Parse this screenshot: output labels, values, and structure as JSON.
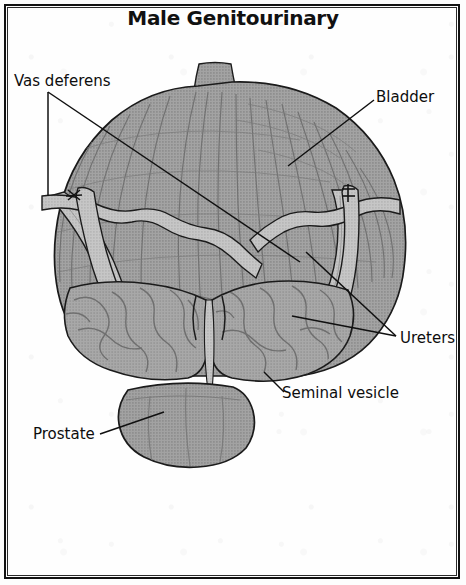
{
  "figure": {
    "title": "Male Genitourinary",
    "type": "anatomical-illustration",
    "style": "grayscale halftone line drawing",
    "border": "#121212",
    "background": "#fefefe"
  },
  "labels": {
    "vas_deferens": "Vas deferens",
    "bladder": "Bladder",
    "ureters": "Ureters",
    "seminal_vesicle": "Seminal  vesicle",
    "prostate": "Prostate"
  },
  "structures": [
    {
      "name": "bladder",
      "description": "large dome-shaped muscular organ with vertical detrusor striations, occupies upper two-thirds"
    },
    {
      "name": "urachus",
      "description": "small stalk at apex of bladder dome"
    },
    {
      "name": "ureter-left",
      "description": "pale tubular band descending from upper left into bladder base"
    },
    {
      "name": "ureter-right",
      "description": "pale tubular band descending vertically on right into bladder base"
    },
    {
      "name": "vas-deferens-left",
      "description": "pale tube crossing obliquely with cut marker"
    },
    {
      "name": "vas-deferens-right",
      "description": "pale tube crossing obliquely with cut marker"
    },
    {
      "name": "seminal-vesicle-left",
      "description": "lobulated convoluted sac at lower left of bladder base"
    },
    {
      "name": "seminal-vesicle-right",
      "description": "lobulated convoluted sac at lower right of bladder base"
    },
    {
      "name": "prostate",
      "description": "rounded bilobed gland at the bottom midline"
    }
  ],
  "markers": {
    "left_vas_marker": "✗",
    "right_vas_marker": "✝"
  },
  "colors": {
    "organ_fill": "#9c9c9c",
    "organ_fill_light": "#c2c2c2",
    "outline": "#1b1b1b",
    "detail_line": "#6e6e6e",
    "label_text": "#0d0d0d"
  }
}
